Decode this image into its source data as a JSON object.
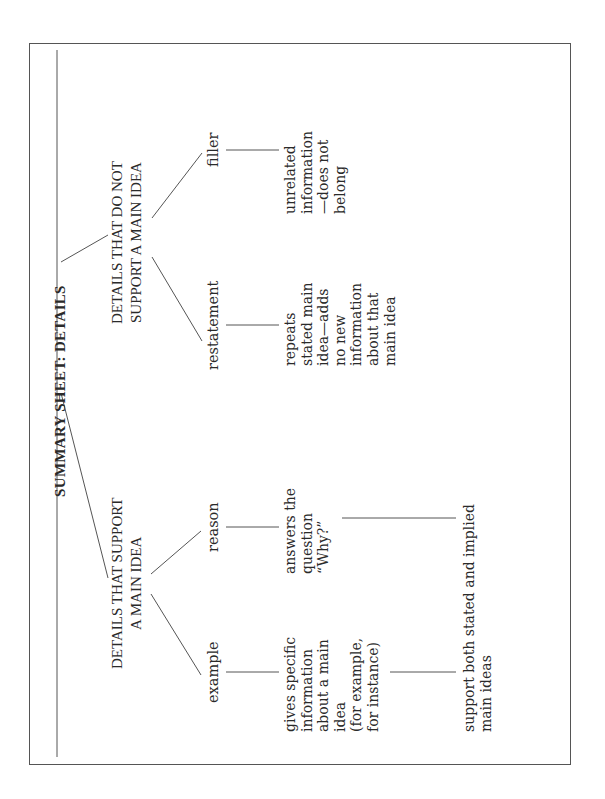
{
  "title": "SUMMARY SHEET: DETAILS",
  "branches": [
    {
      "heading_line1": "DETAILS THAT SUPPORT",
      "heading_line2": "A MAIN IDEA",
      "children": [
        {
          "label": "example",
          "description": "gives specific\ninformation\nabout a main\nidea\n(for example,\nfor instance)"
        },
        {
          "label": "reason",
          "description": "answers the\nquestion\n“Why?”"
        }
      ],
      "shared_note": "support both stated and implied\nmain ideas"
    },
    {
      "heading_line1": "DETAILS THAT DO NOT",
      "heading_line2": "SUPPORT A MAIN IDEA",
      "children": [
        {
          "label": "restatement",
          "description": "repeats\nstated main\nidea—adds\nno new\ninformation\nabout that\nmain idea"
        },
        {
          "label": "filler",
          "description": "unrelated\ninformation\n—does not\nbelong"
        }
      ]
    }
  ],
  "colors": {
    "ink": "#2a2a2a",
    "lines": "#555555",
    "background": "#ffffff"
  }
}
